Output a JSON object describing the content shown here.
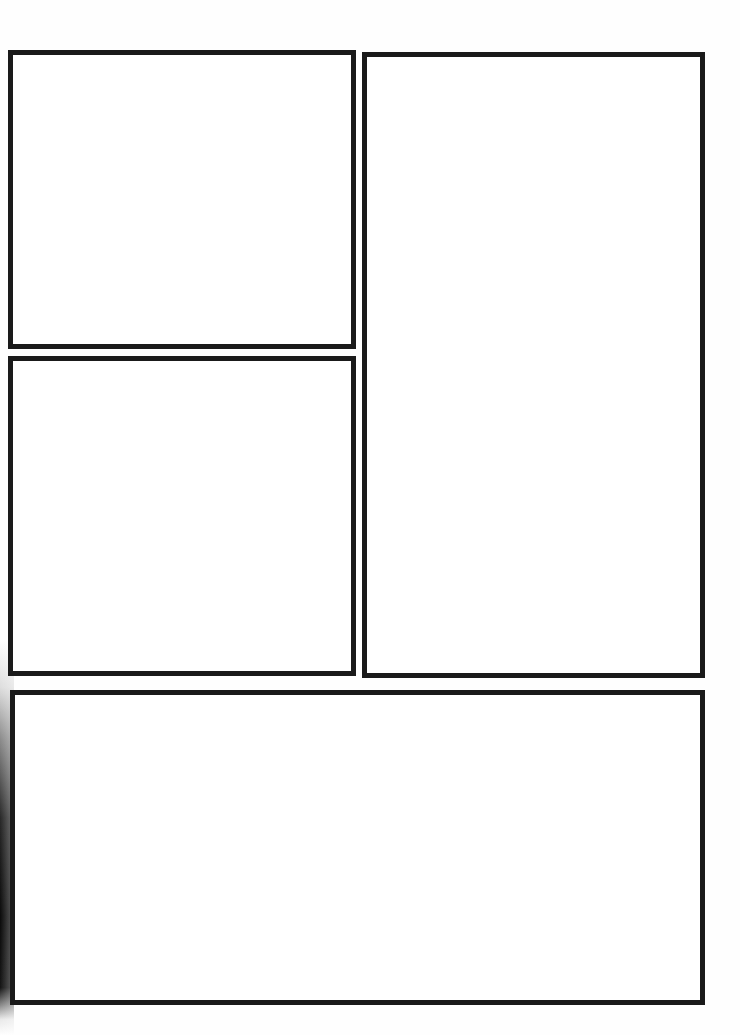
{
  "page": {
    "type": "comic-panel-template",
    "background_color": "#ffffff",
    "border_color": "#1a1a1a",
    "panels": [
      {
        "id": "panel-1",
        "position": "top-left",
        "content": ""
      },
      {
        "id": "panel-2",
        "position": "middle-left",
        "content": ""
      },
      {
        "id": "panel-3",
        "position": "right-tall",
        "content": ""
      },
      {
        "id": "panel-4",
        "position": "bottom-wide",
        "content": ""
      }
    ]
  }
}
